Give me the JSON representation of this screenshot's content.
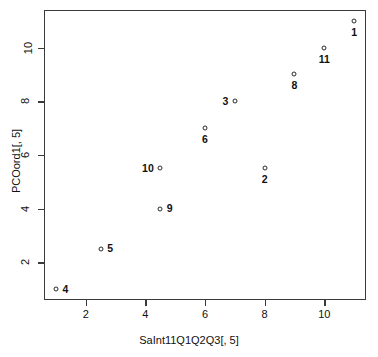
{
  "chart_data": {
    "type": "scatter",
    "title": "",
    "xlabel": "SaInt11Q1Q2Q3[, 5]",
    "ylabel": "PCOord1[, 5]",
    "xlim": [
      0.6,
      11.4
    ],
    "ylim": [
      0.6,
      11.4
    ],
    "grid": false,
    "legend": null,
    "xticks": [
      "2",
      "4",
      "6",
      "8",
      "10"
    ],
    "xtickvalues": [
      2,
      4,
      6,
      8,
      10
    ],
    "yticks": [
      "2",
      "4",
      "6",
      "8",
      "10"
    ],
    "ytickvalues": [
      2,
      4,
      6,
      8,
      10
    ],
    "marker": "open-circle",
    "points": [
      {
        "label": "1",
        "x": 11,
        "y": 11,
        "label_pos": "below"
      },
      {
        "label": "11",
        "x": 10,
        "y": 10,
        "label_pos": "below"
      },
      {
        "label": "8",
        "x": 9,
        "y": 9,
        "label_pos": "below"
      },
      {
        "label": "3",
        "x": 7,
        "y": 8,
        "label_pos": "left"
      },
      {
        "label": "6",
        "x": 6,
        "y": 7,
        "label_pos": "below"
      },
      {
        "label": "2",
        "x": 8,
        "y": 5.5,
        "label_pos": "below"
      },
      {
        "label": "10",
        "x": 4.5,
        "y": 5.5,
        "label_pos": "left"
      },
      {
        "label": "9",
        "x": 4.5,
        "y": 4,
        "label_pos": "right"
      },
      {
        "label": "5",
        "x": 2.5,
        "y": 2.5,
        "label_pos": "right"
      },
      {
        "label": "4",
        "x": 1,
        "y": 1,
        "label_pos": "right"
      }
    ]
  }
}
